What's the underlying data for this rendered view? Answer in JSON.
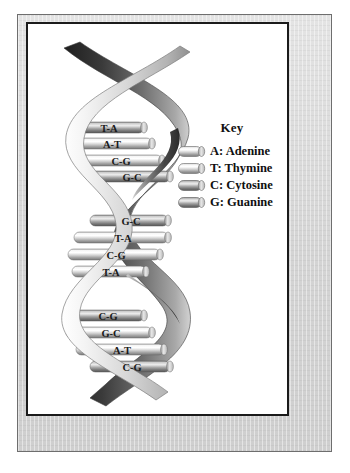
{
  "figure": {
    "frame": {
      "mat_color": "#d9d9d9",
      "border_color": "#1b1b1b",
      "page_color": "#ffffff"
    }
  },
  "key": {
    "title": "Key",
    "entries": [
      {
        "code": "A",
        "label": "A: Adenine",
        "swatch_icon": "nucleotide-cylinder-icon",
        "tone": "light"
      },
      {
        "code": "T",
        "label": "T: Thymine",
        "swatch_icon": "nucleotide-cylinder-icon",
        "tone": "light"
      },
      {
        "code": "C",
        "label": "C: Cytosine",
        "swatch_icon": "nucleotide-cylinder-icon",
        "tone": "dark"
      },
      {
        "code": "G",
        "label": "G: Guanine",
        "swatch_icon": "nucleotide-cylinder-icon",
        "tone": "dark"
      }
    ]
  },
  "helix": {
    "turns": 3,
    "rungs_per_turn": 4,
    "base_pairs": [
      {
        "label": "T-A",
        "turn": 1,
        "index": 1
      },
      {
        "label": "A-T",
        "turn": 1,
        "index": 2
      },
      {
        "label": "C-G",
        "turn": 1,
        "index": 3
      },
      {
        "label": "G-C",
        "turn": 1,
        "index": 4
      },
      {
        "label": "G-C",
        "turn": 2,
        "index": 1
      },
      {
        "label": "T-A",
        "turn": 2,
        "index": 2
      },
      {
        "label": "C-G",
        "turn": 2,
        "index": 3
      },
      {
        "label": "T-A",
        "turn": 2,
        "index": 4
      },
      {
        "label": "C-G",
        "turn": 3,
        "index": 1
      },
      {
        "label": "G-C",
        "turn": 3,
        "index": 2
      },
      {
        "label": "A-T",
        "turn": 3,
        "index": 3
      },
      {
        "label": "C-G",
        "turn": 3,
        "index": 4
      }
    ]
  }
}
